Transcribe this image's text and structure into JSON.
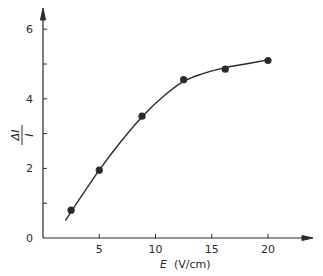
{
  "chart_data": {
    "type": "scatter",
    "title": "",
    "xlabel": "E (V/cm)",
    "xlabel_var": "E",
    "xlabel_unit": "(V/cm)",
    "ylabel": "ΔI / I",
    "ylabel_num": "ΔI",
    "ylabel_den": "I",
    "xlim": [
      0,
      24
    ],
    "ylim": [
      0,
      6.5
    ],
    "x_ticks": [
      5,
      10,
      15,
      20
    ],
    "x_tick_labels": [
      "5",
      "10",
      "15",
      "20"
    ],
    "y_ticks": [
      0,
      1,
      2,
      3,
      4,
      5,
      6
    ],
    "y_tick_labels": [
      "0",
      "",
      "2",
      "",
      "4",
      "",
      "6"
    ],
    "grid": false,
    "legend": null,
    "series": [
      {
        "name": "measured",
        "marker": "filled-circle",
        "x": [
          2.5,
          5.0,
          8.8,
          12.5,
          16.2,
          20.0
        ],
        "y": [
          0.8,
          1.95,
          3.5,
          4.55,
          4.85,
          5.1
        ]
      },
      {
        "name": "fit curve",
        "style": "solid-line",
        "x": [
          2.0,
          3.0,
          5.0,
          7.0,
          9.0,
          11.0,
          12.5,
          14.0,
          16.0,
          18.0,
          20.0
        ],
        "y": [
          0.5,
          1.0,
          1.95,
          2.8,
          3.55,
          4.15,
          4.5,
          4.7,
          4.88,
          5.0,
          5.12
        ]
      }
    ],
    "colors": {
      "ink": "#2a2a2a",
      "background": "#ffffff"
    }
  }
}
